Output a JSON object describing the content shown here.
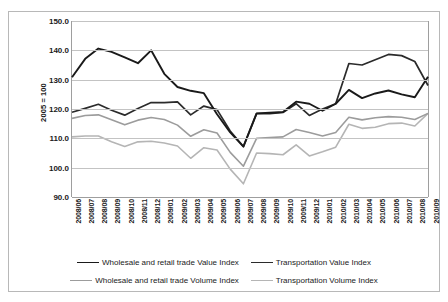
{
  "chart_data": {
    "type": "line",
    "title": "",
    "subtitle": "",
    "xlabel": "",
    "ylabel": "2005 = 100",
    "ylim": [
      90.0,
      150.0
    ],
    "ytick_labels": [
      "150.0",
      "140.0",
      "130.0",
      "120.0",
      "110.0",
      "100.0",
      "90.0"
    ],
    "ytick_values": [
      150.0,
      140.0,
      130.0,
      120.0,
      110.0,
      100.0,
      90.0
    ],
    "grid": true,
    "legend_position": "bottom",
    "categories": [
      "2008/06",
      "2008/07",
      "2008/08",
      "2008/09",
      "2008/10",
      "2008/11",
      "2008/12",
      "2009/01",
      "2009/02",
      "2009/03",
      "2009/04",
      "2009/05",
      "2009/06",
      "2009/07",
      "2009/08",
      "2009/09",
      "2009/10",
      "2009/11",
      "2009/12",
      "2010/01",
      "2010/02",
      "2010/03",
      "2010/04",
      "2010/05",
      "2010/06",
      "2010/07",
      "2010/08",
      "2010/09"
    ],
    "series": [
      {
        "name": "Wholesale and retail trade Value Index",
        "color": "#1a1a1a",
        "width": 1.9,
        "values": [
          130.8,
          137.1,
          140.6,
          139.5,
          137.6,
          135.6,
          140.0,
          132.0,
          127.5,
          126.2,
          125.4,
          118.2,
          112.0,
          107.2,
          118.5,
          118.7,
          119.0,
          122.5,
          121.8,
          119.4,
          121.8,
          126.5,
          123.7,
          125.3,
          126.3,
          125.0,
          124.0,
          131.0
        ]
      },
      {
        "name": "Transportation Value Index",
        "color": "#2b2b2b",
        "width": 1.7,
        "values": [
          118.9,
          120.2,
          121.6,
          119.6,
          117.9,
          120.2,
          122.2,
          122.2,
          122.4,
          118.0,
          121.0,
          119.8,
          112.5,
          107.2,
          118.4,
          118.4,
          118.8,
          121.8,
          117.8,
          120.0,
          121.8,
          135.5,
          135.0,
          136.8,
          138.6,
          138.2,
          136.2,
          128.0
        ]
      },
      {
        "name": "Wholesale and retail trade Volume Index",
        "color": "#9c9c9c",
        "width": 1.6,
        "values": [
          116.8,
          117.8,
          118.0,
          116.3,
          114.6,
          116.2,
          117.1,
          116.4,
          114.5,
          110.7,
          112.9,
          111.8,
          105.2,
          100.5,
          110.0,
          110.3,
          110.5,
          113.0,
          112.0,
          110.8,
          112.0,
          117.2,
          116.3,
          117.0,
          117.4,
          117.2,
          116.4,
          118.5
        ]
      },
      {
        "name": "Transportation Volume Index",
        "color": "#b5b5b5",
        "width": 1.6,
        "values": [
          110.5,
          110.8,
          110.8,
          108.8,
          107.2,
          108.8,
          109.0,
          108.4,
          107.4,
          103.2,
          106.8,
          106.0,
          99.5,
          94.5,
          105.0,
          104.8,
          104.4,
          107.8,
          104.0,
          105.4,
          107.0,
          114.8,
          113.4,
          113.8,
          115.0,
          115.2,
          114.2,
          118.5
        ]
      }
    ]
  }
}
